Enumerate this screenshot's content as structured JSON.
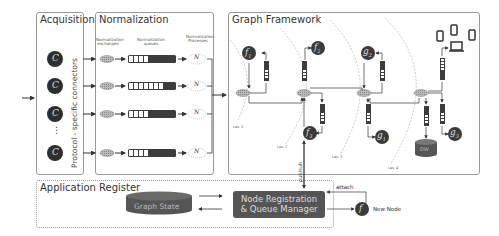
{
  "panels": {
    "acquisition": {
      "title": "Acquisition",
      "side_label": "Protocol - specific connectors",
      "connector_symbol": "C",
      "ellipsis": "⋮"
    },
    "normalization": {
      "title": "Normalization",
      "col_exchanges": "Normalization exchanges",
      "col_queues": "Normalization queues",
      "col_processes": "Normalization Processes",
      "process_symbol": "N"
    },
    "graph_framework": {
      "title": "Graph Framework",
      "nodes": [
        {
          "id": "f1",
          "base": "f",
          "sub": "1"
        },
        {
          "id": "f2",
          "base": "f",
          "sub": "2"
        },
        {
          "id": "f3",
          "base": "f",
          "sub": "3"
        },
        {
          "id": "g1",
          "base": "g",
          "sub": "1"
        },
        {
          "id": "g2",
          "base": "g",
          "sub": "2"
        },
        {
          "id": "g3",
          "base": "g",
          "sub": "3"
        }
      ],
      "levels": [
        "Lev. 1",
        "Lev. 2",
        "Lev. 3",
        "Lev. 4"
      ],
      "db_label": "DW",
      "pubsub_label": "pub/sub"
    },
    "app_register": {
      "title": "Application Register",
      "graph_state": "Graph State",
      "manager_line1": "Node Registration",
      "manager_line2": "& Queue Manager"
    }
  },
  "external": {
    "attach_label": "attach",
    "new_node_symbol": "f",
    "new_node_label": "New Node"
  },
  "colors": {
    "dark_node": "#3a3a3a",
    "queue_dark": "#3c3c3c",
    "panel_border": "#999999",
    "box_fill": "#5a5a5a"
  }
}
